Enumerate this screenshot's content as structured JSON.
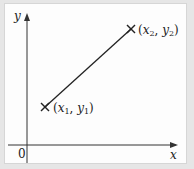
{
  "diagram": {
    "type": "coordinate-line-segment",
    "axes": {
      "x_label": "x",
      "y_label": "y",
      "origin_label": "0"
    },
    "points": [
      {
        "name": "point-1",
        "label": "(x₁, y₁)",
        "x_var": "x",
        "x_sub": "1",
        "y_var": "y",
        "y_sub": "1",
        "marker": "cross"
      },
      {
        "name": "point-2",
        "label": "(x₂, y₂)",
        "x_var": "x",
        "x_sub": "2",
        "y_var": "y",
        "y_sub": "2",
        "marker": "cross"
      }
    ],
    "segment": {
      "from": "point-1",
      "to": "point-2"
    },
    "colors": {
      "ink": "#222222",
      "panel": "#fdfdfd",
      "background": "#e6e6e6"
    }
  }
}
